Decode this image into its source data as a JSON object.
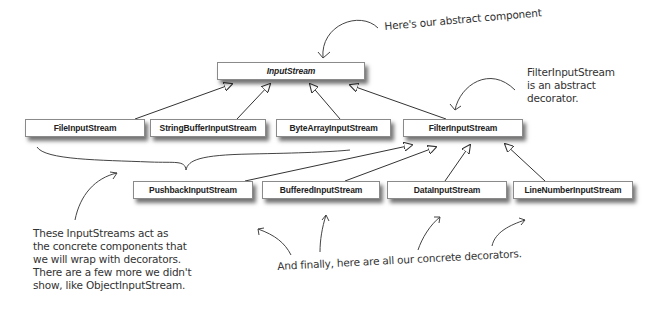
{
  "diagram": {
    "abstract_component": {
      "label": "InputStream"
    },
    "concrete_components": [
      {
        "label": "FileInputStream"
      },
      {
        "label": "StringBufferInputStream"
      },
      {
        "label": "ByteArrayInputStream"
      }
    ],
    "abstract_decorator": {
      "label": "FilterInputStream"
    },
    "concrete_decorators": [
      {
        "label": "PushbackInputStream"
      },
      {
        "label": "BufferedInputStream"
      },
      {
        "label": "DataInputStream"
      },
      {
        "label": "LineNumberInputStream"
      }
    ],
    "annotations": {
      "abstract_component_note": "Here's our abstract component",
      "abstract_decorator_note": "FilterInputStream\nis an abstract\ndecorator.",
      "concrete_components_note": "These InputStreams act as\nthe concrete components that\nwe will wrap with decorators.\nThere are a few more we didn't\nshow, like ObjectInputStream.",
      "concrete_decorators_note": "And finally, here are all our concrete decorators."
    },
    "colors": {
      "line": "#333333",
      "box_border": "#8a8a8a",
      "text": "#222222",
      "note_text": "#333333"
    }
  }
}
